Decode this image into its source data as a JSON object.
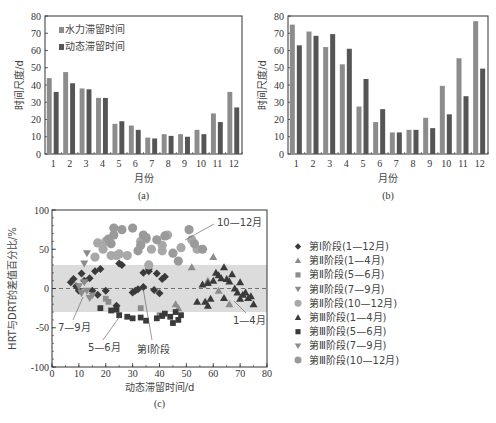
{
  "chart_data": [
    {
      "id": "a",
      "type": "bar",
      "caption": "(a)",
      "title": "",
      "xlabel": "月份",
      "ylabel": "时间尺度/d",
      "ylim": [
        0,
        80
      ],
      "yticks": [
        0,
        10,
        20,
        30,
        40,
        50,
        60,
        70,
        80
      ],
      "categories": [
        "1",
        "2",
        "3",
        "4",
        "5",
        "6",
        "7",
        "8",
        "9",
        "10",
        "11",
        "12"
      ],
      "legend_position": "upper-left",
      "series": [
        {
          "name": "水力滞留时间",
          "color": "#8c8c8c",
          "values": [
            44,
            47.5,
            38,
            32.5,
            17.5,
            16.5,
            9.5,
            11.5,
            11.5,
            14,
            23.5,
            36
          ]
        },
        {
          "name": "动态滞留时间",
          "color": "#555555",
          "values": [
            36,
            41,
            37.5,
            32.5,
            19,
            14,
            9,
            10.5,
            10,
            11.5,
            18.5,
            27
          ]
        }
      ]
    },
    {
      "id": "b",
      "type": "bar",
      "caption": "(b)",
      "title": "",
      "xlabel": "月份",
      "ylabel": "时间尺度/d",
      "ylim": [
        0,
        80
      ],
      "yticks": [
        0,
        10,
        20,
        30,
        40,
        50,
        60,
        70,
        80
      ],
      "categories": [
        "1",
        "2",
        "3",
        "4",
        "5",
        "6",
        "7",
        "8",
        "9",
        "10",
        "11",
        "12"
      ],
      "series": [
        {
          "name": "水力滞留时间",
          "color": "#8c8c8c",
          "values": [
            75,
            71,
            62,
            52,
            27.5,
            18.5,
            12.5,
            14,
            21,
            39.5,
            55.5,
            77
          ]
        },
        {
          "name": "动态滞留时间",
          "color": "#555555",
          "values": [
            63,
            68.5,
            69.5,
            61,
            43.5,
            26,
            12.5,
            14,
            15,
            23,
            33.5,
            49.5
          ]
        }
      ]
    },
    {
      "id": "c",
      "type": "scatter",
      "caption": "(c)",
      "title": "",
      "xlabel": "动态滞留时间/d",
      "ylabel": "HRT与DRT的差值百分比/%",
      "xlim": [
        0,
        80
      ],
      "ylim": [
        -100,
        100
      ],
      "xticks": [
        0,
        10,
        20,
        30,
        40,
        50,
        60,
        70,
        80
      ],
      "yticks": [
        -100,
        -50,
        0,
        50,
        100
      ],
      "shaded_band": [
        -30,
        30
      ],
      "reference_line": 0,
      "legend_position": "right",
      "annotations": [
        "10—12月",
        "7—9月",
        "5—6月",
        "第Ⅰ阶段",
        "1—4月"
      ],
      "series": [
        {
          "name": "第Ⅰ阶段(1—12月)",
          "marker": "diamond",
          "color": "#3a3a3a",
          "points": [
            [
              7,
              8
            ],
            [
              8,
              12
            ],
            [
              9,
              3
            ],
            [
              10,
              -3
            ],
            [
              11,
              19
            ],
            [
              12,
              10
            ],
            [
              14,
              13
            ],
            [
              16,
              22
            ],
            [
              17,
              -8
            ],
            [
              15,
              -3
            ],
            [
              18,
              25
            ],
            [
              20,
              -3
            ],
            [
              24,
              -22
            ],
            [
              25,
              32
            ],
            [
              26,
              30
            ],
            [
              30,
              -5
            ],
            [
              31,
              -3
            ],
            [
              32,
              -1
            ],
            [
              34,
              2
            ],
            [
              34,
              20
            ],
            [
              36,
              22
            ],
            [
              38,
              -2
            ],
            [
              39,
              19
            ],
            [
              40,
              -6
            ],
            [
              41,
              12
            ],
            [
              42,
              15
            ],
            [
              36,
              25
            ]
          ]
        },
        {
          "name": "第Ⅱ阶段(1—4月)",
          "marker": "triangle-up",
          "color": "#8c8c8c",
          "points": [
            [
              46,
              -20
            ],
            [
              47,
              -25
            ],
            [
              60,
              40
            ],
            [
              52,
              27
            ],
            [
              58,
              10
            ],
            [
              62,
              -3
            ],
            [
              66,
              -20
            ]
          ]
        },
        {
          "name": "第Ⅱ阶段(5—6月)",
          "marker": "square",
          "color": "#8c8c8c",
          "points": [
            [
              20,
              -13
            ],
            [
              21,
              -17
            ],
            [
              33,
              -25
            ],
            [
              40,
              -34
            ]
          ]
        },
        {
          "name": "第Ⅱ阶段(7—9月)",
          "marker": "triangle-down",
          "color": "#8c8c8c",
          "points": [
            [
              11,
              -5
            ],
            [
              12,
              8
            ],
            [
              13,
              -3
            ],
            [
              14,
              -12
            ],
            [
              15,
              -9
            ],
            [
              10,
              3
            ]
          ]
        },
        {
          "name": "第Ⅱ阶段(10—12月)",
          "marker": "circle",
          "color": "#a8a8a8",
          "points": [
            [
              16,
              40
            ],
            [
              17,
              58
            ],
            [
              19,
              50
            ],
            [
              20,
              60
            ],
            [
              22,
              42
            ],
            [
              24,
              42
            ],
            [
              25,
              44
            ],
            [
              28,
              42
            ],
            [
              33,
              60
            ],
            [
              35,
              63
            ],
            [
              37,
              50
            ],
            [
              41,
              48
            ],
            [
              41,
              55
            ],
            [
              43,
              68
            ],
            [
              48,
              52
            ],
            [
              52,
              62
            ],
            [
              54,
              50
            ],
            [
              36,
              30
            ]
          ]
        },
        {
          "name": "第Ⅲ阶段(1—4月)",
          "marker": "triangle-up",
          "color": "#3a3a3a",
          "points": [
            [
              54,
              -17
            ],
            [
              57,
              -17
            ],
            [
              58,
              -22
            ],
            [
              59,
              -13
            ],
            [
              58,
              7
            ],
            [
              60,
              10
            ],
            [
              61,
              20
            ],
            [
              62,
              17
            ],
            [
              64,
              27
            ],
            [
              63,
              13
            ],
            [
              65,
              12
            ],
            [
              66,
              9
            ],
            [
              67,
              18
            ],
            [
              68,
              0
            ],
            [
              69,
              -5
            ],
            [
              70,
              8
            ],
            [
              70,
              -13
            ],
            [
              71,
              -8
            ],
            [
              72,
              -5
            ],
            [
              73,
              -12
            ],
            [
              74,
              -10
            ],
            [
              75,
              -20
            ],
            [
              64,
              -12
            ],
            [
              56,
              5
            ]
          ]
        },
        {
          "name": "第Ⅲ阶段(5—6月)",
          "marker": "square",
          "color": "#3a3a3a",
          "points": [
            [
              18,
              -25
            ],
            [
              22,
              -28
            ],
            [
              24,
              -27
            ],
            [
              25,
              -34
            ],
            [
              28,
              -36
            ],
            [
              30,
              -38
            ],
            [
              33,
              -37
            ],
            [
              35,
              -41
            ],
            [
              39,
              -38
            ],
            [
              41,
              -35
            ],
            [
              42,
              -32
            ],
            [
              44,
              -36
            ],
            [
              45,
              -44
            ],
            [
              47,
              -40
            ],
            [
              48,
              -34
            ],
            [
              46,
              -30
            ]
          ]
        },
        {
          "name": "第Ⅲ阶段(7—9月)",
          "marker": "triangle-down",
          "color": "#8c8c8c",
          "points": [
            [
              13,
              45
            ],
            [
              12,
              32
            ],
            [
              11,
              -6
            ]
          ]
        },
        {
          "name": "第Ⅲ阶段(10—12月)",
          "marker": "circle",
          "color": "#9a9a9a",
          "points": [
            [
              23,
              77
            ],
            [
              26,
              75
            ],
            [
              30,
              77
            ],
            [
              23,
              68
            ],
            [
              21,
              63
            ],
            [
              22,
              57
            ],
            [
              34,
              68
            ],
            [
              35,
              65
            ],
            [
              33,
              55
            ],
            [
              32,
              48
            ],
            [
              39,
              62
            ],
            [
              42,
              67
            ],
            [
              45,
              45
            ],
            [
              47,
              35
            ],
            [
              51,
              75
            ],
            [
              53,
              57
            ],
            [
              56,
              50
            ]
          ]
        }
      ]
    }
  ],
  "legend_c": [
    {
      "label": "第Ⅰ阶段(1—12月)",
      "marker": "diamond",
      "color": "#3a3a3a"
    },
    {
      "label": "第Ⅱ阶段(1—4月)",
      "marker": "triangle-up",
      "color": "#8c8c8c"
    },
    {
      "label": "第Ⅱ阶段(5—6月)",
      "marker": "square",
      "color": "#8c8c8c"
    },
    {
      "label": "第Ⅱ阶段(7—9月)",
      "marker": "triangle-down",
      "color": "#8c8c8c"
    },
    {
      "label": "第Ⅱ阶段(10—12月)",
      "marker": "circle",
      "color": "#a8a8a8"
    },
    {
      "label": "第Ⅲ阶段(1—4月)",
      "marker": "triangle-up",
      "color": "#3a3a3a"
    },
    {
      "label": "第Ⅲ阶段(5—6月)",
      "marker": "square",
      "color": "#3a3a3a"
    },
    {
      "label": "第Ⅲ阶段(7—9月)",
      "marker": "triangle-down",
      "color": "#8c8c8c"
    },
    {
      "label": "第Ⅲ阶段(10—12月)",
      "marker": "circle",
      "color": "#9a9a9a"
    }
  ]
}
